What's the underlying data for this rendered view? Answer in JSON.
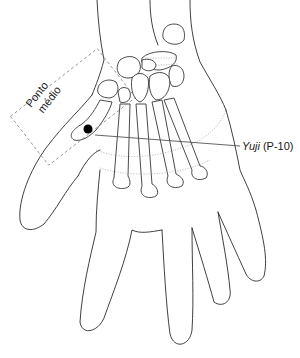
{
  "figure": {
    "labels": {
      "box_label_line1": "Ponto",
      "box_label_line2": "médio",
      "point_name": "Yuji",
      "point_code": "(P-10)"
    },
    "colors": {
      "line": "#2a2a2a",
      "dashed_box": "#8a8a8a",
      "point_marker": "#000000",
      "background": "#ffffff"
    },
    "point_marker": {
      "x": 88,
      "y": 129,
      "r": 4.5
    },
    "leader_line": {
      "x1": 95,
      "y1": 137,
      "x2": 240,
      "y2": 146
    }
  }
}
